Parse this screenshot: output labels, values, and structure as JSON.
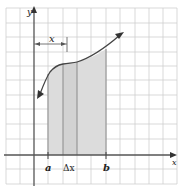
{
  "diagram": {
    "title": "",
    "axes": {
      "x_label": "x",
      "y_label": "y"
    },
    "labels": {
      "a": "a",
      "b": "b",
      "delta_x": "Δx",
      "x_bracket": "x"
    },
    "colors": {
      "grid": "#c8c8c8",
      "axis": "#555555",
      "curve": "#444444",
      "shade": "#d9d9d9",
      "slice_line": "#8a8a8a"
    }
  }
}
